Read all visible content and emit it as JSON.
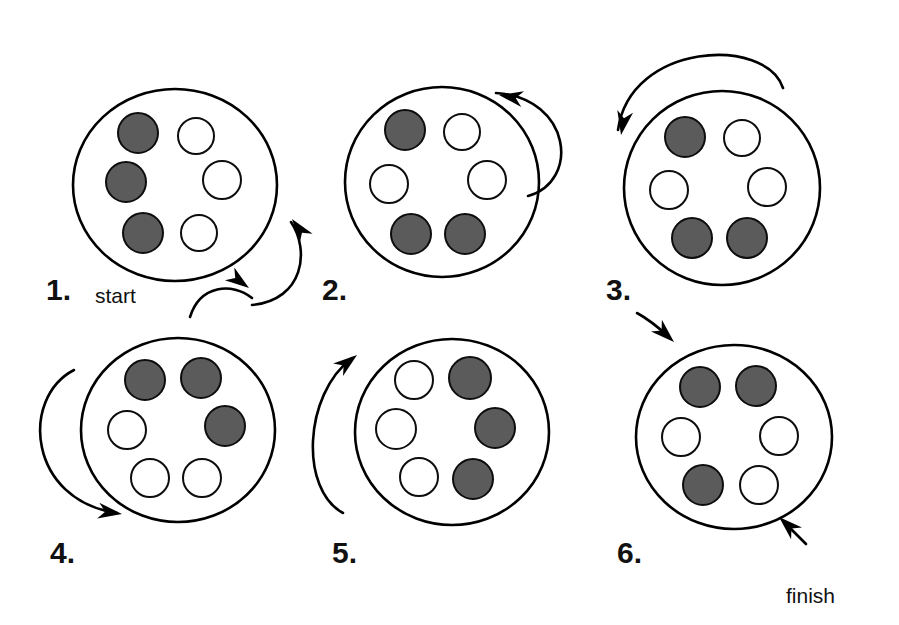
{
  "figure": {
    "title": "",
    "background_color": "#ffffff",
    "token_filled_color": "#5b5b5b",
    "token_empty_color": "#ffffff",
    "outline_color": "#000000"
  },
  "annotations": {
    "start": "start",
    "finish": "finish"
  },
  "steps": [
    {
      "label": "1.",
      "cx": 175,
      "cy": 185,
      "rx": 102,
      "ry": 96,
      "label_x": 46,
      "label_y": 300,
      "tokens": [
        {
          "position": "top-left",
          "dx": -37,
          "dy": -52,
          "r": 20,
          "state": "filled"
        },
        {
          "position": "top-right",
          "dx": 21,
          "dy": -49,
          "r": 18,
          "state": "empty"
        },
        {
          "position": "left",
          "dx": -49,
          "dy": -3,
          "r": 20,
          "state": "filled"
        },
        {
          "position": "right",
          "dx": 47,
          "dy": -5,
          "r": 19,
          "state": "empty"
        },
        {
          "position": "bottom-left",
          "dx": -32,
          "dy": 48,
          "r": 20,
          "state": "filled"
        },
        {
          "position": "bottom-right",
          "dx": 24,
          "dy": 48,
          "r": 18,
          "state": "empty"
        }
      ]
    },
    {
      "label": "2.",
      "cx": 442,
      "cy": 182,
      "rx": 97,
      "ry": 95,
      "label_x": 322,
      "label_y": 300,
      "tokens": [
        {
          "position": "top-left",
          "dx": -37,
          "dy": -52,
          "r": 20,
          "state": "filled"
        },
        {
          "position": "top-right",
          "dx": 20,
          "dy": -50,
          "r": 18,
          "state": "empty"
        },
        {
          "position": "left",
          "dx": -53,
          "dy": 2,
          "r": 19,
          "state": "empty"
        },
        {
          "position": "right",
          "dx": 45,
          "dy": -2,
          "r": 19,
          "state": "empty"
        },
        {
          "position": "bottom-left",
          "dx": -31,
          "dy": 52,
          "r": 20,
          "state": "filled"
        },
        {
          "position": "bottom-right",
          "dx": 23,
          "dy": 52,
          "r": 20,
          "state": "filled"
        }
      ]
    },
    {
      "label": "3.",
      "cx": 722,
      "cy": 188,
      "rx": 98,
      "ry": 97,
      "label_x": 606,
      "label_y": 300,
      "tokens": [
        {
          "position": "top-left",
          "dx": -37,
          "dy": -51,
          "r": 20,
          "state": "filled"
        },
        {
          "position": "top-right",
          "dx": 20,
          "dy": -50,
          "r": 18,
          "state": "empty"
        },
        {
          "position": "left",
          "dx": -53,
          "dy": 2,
          "r": 19,
          "state": "empty"
        },
        {
          "position": "right",
          "dx": 45,
          "dy": -1,
          "r": 19,
          "state": "empty"
        },
        {
          "position": "bottom-left",
          "dx": -30,
          "dy": 50,
          "r": 20,
          "state": "filled"
        },
        {
          "position": "bottom-right",
          "dx": 25,
          "dy": 50,
          "r": 20,
          "state": "filled"
        }
      ]
    },
    {
      "label": "4.",
      "cx": 178,
      "cy": 430,
      "rx": 97,
      "ry": 92,
      "label_x": 50,
      "label_y": 563,
      "tokens": [
        {
          "position": "top-left",
          "dx": -33,
          "dy": -50,
          "r": 20,
          "state": "filled"
        },
        {
          "position": "top-right",
          "dx": 23,
          "dy": -52,
          "r": 20,
          "state": "filled"
        },
        {
          "position": "left",
          "dx": -51,
          "dy": 0,
          "r": 19,
          "state": "empty"
        },
        {
          "position": "right",
          "dx": 47,
          "dy": -4,
          "r": 20,
          "state": "filled"
        },
        {
          "position": "bottom-left",
          "dx": -28,
          "dy": 48,
          "r": 19,
          "state": "empty"
        },
        {
          "position": "bottom-right",
          "dx": 24,
          "dy": 48,
          "r": 19,
          "state": "empty"
        }
      ]
    },
    {
      "label": "5.",
      "cx": 452,
      "cy": 432,
      "rx": 97,
      "ry": 93,
      "label_x": 332,
      "label_y": 563,
      "tokens": [
        {
          "position": "top-left",
          "dx": -38,
          "dy": -52,
          "r": 19,
          "state": "empty"
        },
        {
          "position": "top-right",
          "dx": 18,
          "dy": -54,
          "r": 21,
          "state": "filled"
        },
        {
          "position": "left",
          "dx": -56,
          "dy": -3,
          "r": 20,
          "state": "empty"
        },
        {
          "position": "right",
          "dx": 43,
          "dy": -4,
          "r": 20,
          "state": "filled"
        },
        {
          "position": "bottom-left",
          "dx": -33,
          "dy": 45,
          "r": 19,
          "state": "empty"
        },
        {
          "position": "bottom-right",
          "dx": 21,
          "dy": 47,
          "r": 20,
          "state": "filled"
        }
      ]
    },
    {
      "label": "6.",
      "cx": 734,
      "cy": 437,
      "rx": 98,
      "ry": 92,
      "label_x": 617,
      "label_y": 563,
      "tokens": [
        {
          "position": "top-left",
          "dx": -34,
          "dy": -50,
          "r": 20,
          "state": "filled"
        },
        {
          "position": "top-right",
          "dx": 22,
          "dy": -51,
          "r": 20,
          "state": "filled"
        },
        {
          "position": "left",
          "dx": -53,
          "dy": 0,
          "r": 19,
          "state": "empty"
        },
        {
          "position": "right",
          "dx": 45,
          "dy": -1,
          "r": 19,
          "state": "empty"
        },
        {
          "position": "bottom-left",
          "dx": -31,
          "dy": 48,
          "r": 20,
          "state": "filled"
        },
        {
          "position": "bottom-right",
          "dx": 25,
          "dy": 48,
          "r": 19,
          "state": "empty"
        }
      ]
    }
  ],
  "arrows": [
    {
      "name": "start-arrow",
      "from": "start",
      "to": "step-1",
      "path": "M 190 317 C 200 285 232 282 252 298",
      "head_x": 249,
      "head_y": 288,
      "head_angle": 36
    },
    {
      "name": "step-1-to-step-2-arrow",
      "from": "step-1",
      "to": "step-2",
      "path": "M 252 305 C 304 300 310 250 291 222",
      "head_x": 292,
      "head_y": 219,
      "head_angle": -126
    },
    {
      "name": "step-2-to-step-3-arrow",
      "from": "step-2",
      "to": "step-3",
      "path": "M 528 196 C 580 182 572 98 496 93",
      "head_x": 499,
      "head_y": 95,
      "head_angle": 190
    },
    {
      "name": "step-3-entry-arrow",
      "from": "step-2",
      "to": "step-3",
      "path": "M 618 130 C 630 42 766 36 783 88",
      "head_x": 621,
      "head_y": 135,
      "head_angle": 100
    },
    {
      "name": "step-3-to-step-4-arrow",
      "from": "step-3",
      "to": "step-4",
      "path": "M 74 370 C 20 398 28 500 117 513",
      "head_x": 122,
      "head_y": 514,
      "head_angle": 8
    },
    {
      "name": "step-4-to-step-5-arrow",
      "from": "step-4",
      "to": "step-5",
      "path": "M 343 513 C 300 490 303 395 352 358",
      "head_x": 357,
      "head_y": 355,
      "head_angle": -38
    },
    {
      "name": "step-5-to-step-6-arrow",
      "from": "step-5",
      "to": "step-6",
      "path": "M 637 313 C 650 320 658 327 669 337",
      "head_x": 674,
      "head_y": 342,
      "head_angle": 43
    },
    {
      "name": "finish-arrow",
      "from": "step-6",
      "to": "finish",
      "path": "M 806 544 C 798 536 791 529 784 522",
      "head_x": 779,
      "head_y": 517,
      "head_angle": 223
    }
  ]
}
